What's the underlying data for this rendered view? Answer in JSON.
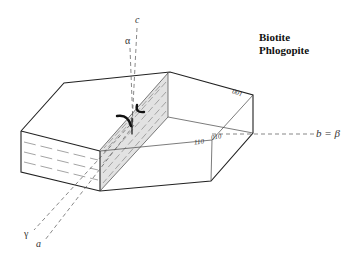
{
  "title": {
    "line1": "Biotite",
    "line2": "Phlogopite"
  },
  "axes": {
    "c": "c",
    "alpha": "α",
    "b_beta": "b = β",
    "gamma": "γ",
    "a": "a"
  },
  "faces": {
    "f001": "001",
    "f110": "110",
    "f010": "010"
  },
  "symbols": {
    "acute_bisectrix": "optic-axis-curved-arrows"
  },
  "colors": {
    "line": "#222222",
    "dashed": "#555555",
    "shade": "#dcdcdc"
  }
}
